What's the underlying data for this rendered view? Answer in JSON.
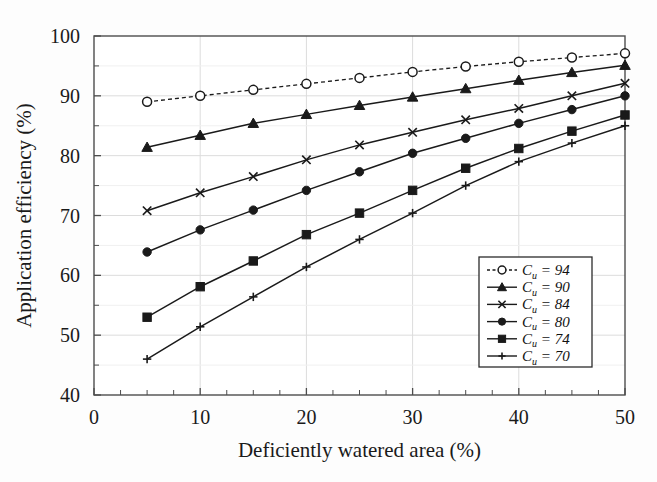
{
  "chart_data": {
    "type": "line",
    "title": "",
    "xlabel": "Deficiently watered area (%)",
    "ylabel": "Application efficiency (%)",
    "xlim": [
      0,
      50
    ],
    "ylim": [
      40,
      100
    ],
    "xticks": [
      0,
      10,
      20,
      30,
      40,
      50
    ],
    "xtick_labels": [
      "0",
      "10",
      "20",
      "30",
      "40",
      "50"
    ],
    "yticks": [
      40,
      50,
      60,
      70,
      80,
      90,
      100
    ],
    "ytick_labels": [
      "40",
      "50",
      "60",
      "70",
      "80",
      "90",
      "100"
    ],
    "x_minor_step": 2.5,
    "y_minor_step": 5,
    "grid": true,
    "grid_color": "#dcdcdc",
    "axis_color": "#4d4d4d",
    "series_color": "#1a1a1a",
    "legend_position": "lower-right",
    "x": [
      5,
      10,
      15,
      20,
      25,
      30,
      35,
      40,
      45,
      50
    ],
    "series": [
      {
        "name": "Cu = 94",
        "symbol": "C",
        "subscript": "u",
        "value": "94",
        "marker": "open-circle",
        "linestyle": "dashed",
        "values": [
          89.0,
          90.0,
          91.0,
          92.0,
          93.0,
          94.0,
          94.9,
          95.7,
          96.4,
          97.1
        ]
      },
      {
        "name": "Cu = 90",
        "symbol": "C",
        "subscript": "u",
        "value": "90",
        "marker": "triangle",
        "linestyle": "solid",
        "values": [
          81.4,
          83.4,
          85.4,
          86.9,
          88.4,
          89.8,
          91.2,
          92.6,
          93.9,
          95.1
        ]
      },
      {
        "name": "Cu = 84",
        "symbol": "C",
        "subscript": "u",
        "value": "84",
        "marker": "cross-x",
        "linestyle": "solid",
        "values": [
          70.8,
          73.8,
          76.5,
          79.3,
          81.8,
          83.9,
          86.0,
          87.9,
          90.0,
          92.1
        ]
      },
      {
        "name": "Cu = 80",
        "symbol": "C",
        "subscript": "u",
        "value": "80",
        "marker": "filled-circle",
        "linestyle": "solid",
        "values": [
          63.9,
          67.6,
          70.9,
          74.2,
          77.3,
          80.4,
          82.9,
          85.4,
          87.7,
          90.0
        ]
      },
      {
        "name": "Cu = 74",
        "symbol": "C",
        "subscript": "u",
        "value": "74",
        "marker": "filled-square",
        "linestyle": "solid",
        "values": [
          53.0,
          58.1,
          62.4,
          66.8,
          70.4,
          74.2,
          77.9,
          81.2,
          84.1,
          86.8
        ]
      },
      {
        "name": "Cu = 70",
        "symbol": "C",
        "subscript": "u",
        "value": "70",
        "marker": "plus",
        "linestyle": "solid",
        "values": [
          46.0,
          51.4,
          56.4,
          61.4,
          66.0,
          70.4,
          75.0,
          79.0,
          82.1,
          85.0
        ]
      }
    ]
  }
}
